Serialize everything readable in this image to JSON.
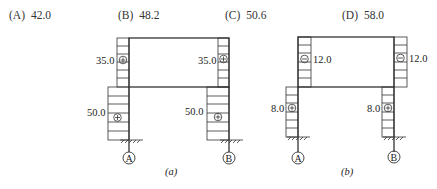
{
  "options": [
    {
      "letter": "(A)",
      "value": "42.0"
    },
    {
      "letter": "(B)",
      "value": "48.2"
    },
    {
      "letter": "(C)",
      "value": "50.6"
    },
    {
      "letter": "(D)",
      "value": "58.0"
    }
  ],
  "figure_a": {
    "caption": "(a)",
    "upper_left_value": "35.0",
    "upper_right_value": "35.0",
    "lower_left_value": "50.0",
    "lower_right_value": "50.0",
    "upper_sign": "+",
    "lower_sign": "+",
    "support_left": "A",
    "support_right": "B"
  },
  "figure_b": {
    "caption": "(b)",
    "upper_left_value": "12.0",
    "upper_right_value": "12.0",
    "lower_left_value": "8.0",
    "lower_right_value": "8.0",
    "upper_sign": "−",
    "lower_sign": "+",
    "support_left": "A",
    "support_right": "B"
  }
}
